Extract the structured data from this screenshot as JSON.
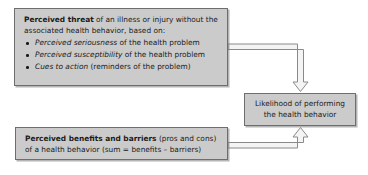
{
  "diagram": {
    "colors": {
      "box_fill": "#cbcbcb",
      "box_border": "#6e6e6e",
      "text": "#1a1a1a",
      "arrow_outline": "#8c8c8c",
      "arrow_fill": "#f2f2f2",
      "background": "#ffffff"
    },
    "nodes": {
      "threat": {
        "lead_bold": "Perceived threat",
        "lead_rest": " of an illness or injury without the associated health behavior, based on:",
        "bullets": [
          {
            "italic": "Perceived seriousness",
            "rest": " of the health problem"
          },
          {
            "italic": "Perceived susceptibility",
            "rest": " of the health problem"
          },
          {
            "italic": "Cues to action",
            "rest": " (reminders of the problem)"
          }
        ]
      },
      "benefits": {
        "lead_bold": "Perceived benefits and barriers",
        "lead_rest": " (pros and cons) of a health behavior (sum = benefits – barriers)"
      },
      "likelihood": {
        "line1": "Likelihood of performing",
        "line2": "the health behavior"
      }
    },
    "arrows": [
      {
        "name": "threat-to-likelihood",
        "from": "threat",
        "to": "likelihood",
        "style": "elbow-right-then-down",
        "head": "hollow-down"
      },
      {
        "name": "benefits-to-likelihood",
        "from": "benefits",
        "to": "likelihood",
        "style": "elbow-right-then-up",
        "head": "hollow-up"
      }
    ]
  }
}
